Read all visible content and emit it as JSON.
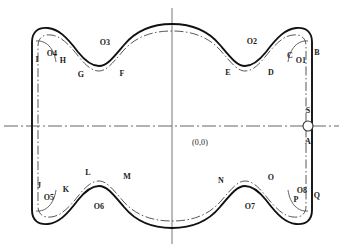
{
  "figure": {
    "origin_label": "(0,0)",
    "colors": {
      "outer_contour": "#111111",
      "inner_contour": "#333333",
      "axis": "#555555",
      "label_text": "#1a1a1a",
      "background": "#ffffff"
    },
    "axes": {
      "horizontal_style": "dash-dot",
      "vertical_style": "solid",
      "horizontal_y": 126,
      "vertical_x": 172
    },
    "marker": {
      "name": "S",
      "shape": "circle",
      "radius": 5,
      "x": 308,
      "y": 126,
      "label_above": "S",
      "label_below": "A"
    },
    "point_labels": [
      {
        "text": "I",
        "x": 37,
        "y": 60
      },
      {
        "text": "O4",
        "x": 52,
        "y": 54
      },
      {
        "text": "H",
        "x": 63,
        "y": 61
      },
      {
        "text": "G",
        "x": 81,
        "y": 75
      },
      {
        "text": "O3",
        "x": 105,
        "y": 43
      },
      {
        "text": "F",
        "x": 122,
        "y": 74
      },
      {
        "text": "E",
        "x": 228,
        "y": 73
      },
      {
        "text": "O2",
        "x": 252,
        "y": 42
      },
      {
        "text": "D",
        "x": 271,
        "y": 73
      },
      {
        "text": "C",
        "x": 290,
        "y": 56
      },
      {
        "text": "O1",
        "x": 301,
        "y": 61
      },
      {
        "text": "B",
        "x": 317,
        "y": 53
      },
      {
        "text": "S",
        "x": 308,
        "y": 111
      },
      {
        "text": "A",
        "x": 308,
        "y": 142
      },
      {
        "text": "Q",
        "x": 317,
        "y": 196
      },
      {
        "text": "O8",
        "x": 302,
        "y": 191
      },
      {
        "text": "P",
        "x": 296,
        "y": 200
      },
      {
        "text": "O",
        "x": 271,
        "y": 178
      },
      {
        "text": "O7",
        "x": 250,
        "y": 207
      },
      {
        "text": "N",
        "x": 221,
        "y": 181
      },
      {
        "text": "M",
        "x": 127,
        "y": 177
      },
      {
        "text": "L",
        "x": 88,
        "y": 173
      },
      {
        "text": "O6",
        "x": 99,
        "y": 207
      },
      {
        "text": "K",
        "x": 66,
        "y": 190
      },
      {
        "text": "O5",
        "x": 49,
        "y": 198
      },
      {
        "text": "J",
        "x": 39,
        "y": 186
      }
    ]
  }
}
